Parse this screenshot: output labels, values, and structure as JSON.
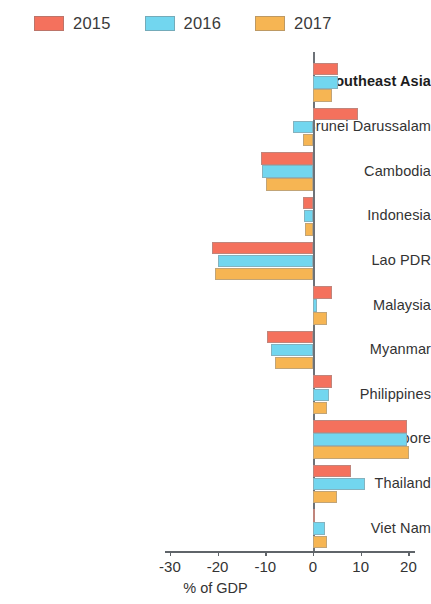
{
  "legend": {
    "position": "top-left",
    "items": [
      {
        "label": "2015",
        "color": "#f4715d"
      },
      {
        "label": "2016",
        "color": "#72d6ef"
      },
      {
        "label": "2017",
        "color": "#f6b553"
      }
    ]
  },
  "chart_data": {
    "type": "bar",
    "orientation": "horizontal",
    "title": "",
    "subtitle": "",
    "xlabel": "% of GDP",
    "ylabel": "",
    "xlim": [
      -32,
      22
    ],
    "xticks": [
      -30,
      -20,
      -10,
      0,
      10,
      20
    ],
    "xtick_labels": [
      "-30",
      "-20",
      "-10",
      "0",
      "10",
      "20"
    ],
    "grid": false,
    "zero_line": 0,
    "categories": [
      "Southeast Asia",
      "Brunei Darussalam",
      "Cambodia",
      "Indonesia",
      "Lao PDR",
      "Malaysia",
      "Myanmar",
      "Philippines",
      "Singapore",
      "Thailand",
      "Viet Nam"
    ],
    "emphasized_categories": [
      "Southeast Asia"
    ],
    "series": [
      {
        "name": "2015",
        "color": "#f4715d",
        "values": [
          5.2,
          9.4,
          -10.8,
          -2.0,
          -21.2,
          3.9,
          -9.6,
          4.0,
          19.7,
          8.0,
          0.5
        ]
      },
      {
        "name": "2016",
        "color": "#72d6ef",
        "values": [
          5.2,
          -4.2,
          -10.6,
          -1.8,
          -20.0,
          0.8,
          -8.8,
          3.4,
          19.8,
          11.0,
          2.6
        ]
      },
      {
        "name": "2017",
        "color": "#f6b553",
        "values": [
          4.0,
          -2.1,
          -9.8,
          -1.7,
          -20.6,
          3.0,
          -7.9,
          2.9,
          20.2,
          5.0,
          3.0
        ]
      }
    ]
  }
}
